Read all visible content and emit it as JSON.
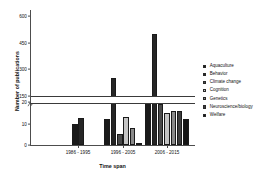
{
  "chart_data": {
    "type": "bar",
    "title": "",
    "xlabel": "Time span",
    "ylabel": "Number of publications",
    "categories": [
      "1986 - 1995",
      "1996 - 2005",
      "2006 - 2015"
    ],
    "legend_position": "right",
    "grid": false,
    "axis_break": {
      "low_max": 20,
      "high_min": 150,
      "note": "broken y-axis between 20 and 150"
    },
    "ylim_lower": [
      0,
      20
    ],
    "ylim_upper": [
      150,
      600
    ],
    "yticks_lower": [
      "0",
      "10",
      "20"
    ],
    "yticks_upper": [
      "150",
      "300",
      "450",
      "600"
    ],
    "series": [
      {
        "name": "Aquaculture",
        "color": "#1a1a1a",
        "values": [
          10,
          22,
          125
        ]
      },
      {
        "name": "Behavior",
        "color": "#262626",
        "values": [
          27,
          250,
          500
        ]
      },
      {
        "name": "Climate change",
        "color": "#4a4a4a",
        "values": [
          0,
          5,
          105
        ]
      },
      {
        "name": "Cognition",
        "color": "#c4c4c4",
        "values": [
          0,
          13,
          15
        ]
      },
      {
        "name": "Genetics",
        "color": "#8a8a8a",
        "values": [
          0,
          8,
          16
        ]
      },
      {
        "name": "Neuroscience/biology",
        "color": "#3d3d3d",
        "values": [
          0,
          1,
          16
        ]
      },
      {
        "name": "Welfare",
        "color": "#141414",
        "values": [
          0,
          0,
          22
        ]
      }
    ]
  },
  "axis": {
    "y_title": "Number of publications",
    "x_title": "Time span",
    "y_ticks": [
      "600",
      "450",
      "300",
      "150",
      "20",
      "10",
      "0"
    ],
    "x_ticks": [
      "1986 - 1995",
      "1996 - 2005",
      "2006 - 2015"
    ]
  },
  "legend": {
    "items": [
      {
        "label": "Aquaculture"
      },
      {
        "label": "Behavior"
      },
      {
        "label": "Climate change"
      },
      {
        "label": "Cognition"
      },
      {
        "label": "Genetics"
      },
      {
        "label": "Neuroscience/biology"
      },
      {
        "label": "Welfare"
      }
    ]
  }
}
